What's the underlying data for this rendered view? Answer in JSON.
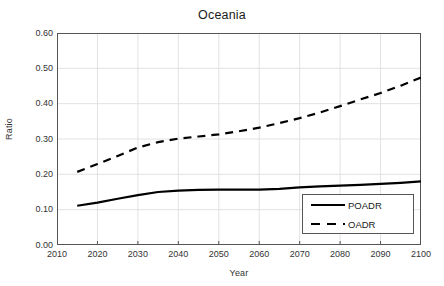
{
  "chart_data": {
    "type": "line",
    "title": "Oceania",
    "xlabel": "Year",
    "ylabel": "Ratio",
    "xlim": [
      2010,
      2100
    ],
    "ylim": [
      0.0,
      0.6
    ],
    "xticks": [
      "2010",
      "2020",
      "2030",
      "2040",
      "2050",
      "2060",
      "2070",
      "2080",
      "2090",
      "2100"
    ],
    "yticks": [
      "0.00",
      "0.10",
      "0.20",
      "0.30",
      "0.40",
      "0.50",
      "0.60"
    ],
    "grid": true,
    "legend_position": "bottom-right",
    "x": [
      2015,
      2020,
      2025,
      2030,
      2035,
      2040,
      2045,
      2050,
      2055,
      2060,
      2065,
      2070,
      2075,
      2080,
      2085,
      2090,
      2095,
      2100
    ],
    "series": [
      {
        "name": "POADR",
        "style": "solid",
        "color": "#000000",
        "values": [
          0.111,
          0.12,
          0.131,
          0.141,
          0.15,
          0.154,
          0.156,
          0.157,
          0.157,
          0.157,
          0.159,
          0.163,
          0.166,
          0.168,
          0.17,
          0.173,
          0.176,
          0.18
        ]
      },
      {
        "name": "OADR",
        "style": "dashed",
        "color": "#000000",
        "values": [
          0.207,
          0.229,
          0.252,
          0.276,
          0.291,
          0.301,
          0.307,
          0.313,
          0.322,
          0.332,
          0.345,
          0.359,
          0.375,
          0.393,
          0.412,
          0.43,
          0.451,
          0.474
        ]
      }
    ]
  },
  "legend": {
    "items": [
      {
        "label": "POADR",
        "style": "solid"
      },
      {
        "label": "OADR",
        "style": "dashed"
      }
    ]
  }
}
